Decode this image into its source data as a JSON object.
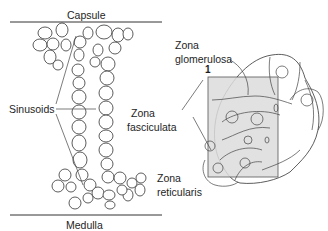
{
  "diagram": {
    "labels": {
      "capsule": "Capsule",
      "medulla": "Medulla",
      "sinusoids": "Sinusoids",
      "zona_glomerulosa_1": "Zona",
      "zona_glomerulosa_2": "glomerulosa",
      "zona_fasciculata_1": "Zona",
      "zona_fasciculata_2": "fasciculata",
      "zona_reticularis_1": "Zona",
      "zona_reticularis_2": "reticularis",
      "marker": "1"
    },
    "colors": {
      "line": "#333333",
      "highlight_box": "#d9d9d9",
      "background": "#ffffff"
    }
  }
}
